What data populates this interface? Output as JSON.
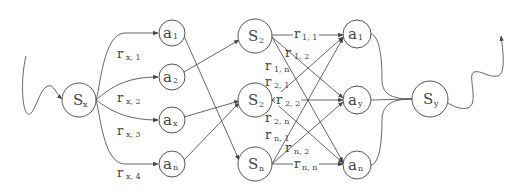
{
  "diagram": {
    "title": "",
    "nodes": {
      "sx": {
        "main": "S",
        "sub": "x"
      },
      "a1": {
        "main": "a",
        "sub": "1"
      },
      "a2": {
        "main": "a",
        "sub": "2"
      },
      "ax": {
        "main": "a",
        "sub": "x"
      },
      "an": {
        "main": "a",
        "sub": "n"
      },
      "s2a": {
        "main": "S",
        "sub": "2"
      },
      "s2b": {
        "main": "S",
        "sub": "2"
      },
      "sn": {
        "main": "S",
        "sub": "n"
      },
      "b1": {
        "main": "a",
        "sub": "1"
      },
      "by": {
        "main": "a",
        "sub": "y"
      },
      "bn": {
        "main": "a",
        "sub": "n"
      },
      "sy": {
        "main": "S",
        "sub": "y"
      }
    },
    "edge_labels": {
      "rx1": {
        "main": "r",
        "sub": "x, 1"
      },
      "rx2": {
        "main": "r",
        "sub": "x, 2"
      },
      "rx3": {
        "main": "r",
        "sub": "x, 3"
      },
      "rx4": {
        "main": "r",
        "sub": "x, 4"
      },
      "r11": {
        "main": "r",
        "sub": "1, 1"
      },
      "r12": {
        "main": "r",
        "sub": "1, 2"
      },
      "r1n": {
        "main": "r",
        "sub": "1, n"
      },
      "r21": {
        "main": "r",
        "sub": "2, 1"
      },
      "r22": {
        "main": "r",
        "sub": "2, 2"
      },
      "r2n": {
        "main": "r",
        "sub": "2, n"
      },
      "rn1": {
        "main": "r",
        "sub": "n, 1"
      },
      "rn2": {
        "main": "r",
        "sub": "n, 2"
      },
      "rnn": {
        "main": "r",
        "sub": "n, n"
      }
    }
  }
}
